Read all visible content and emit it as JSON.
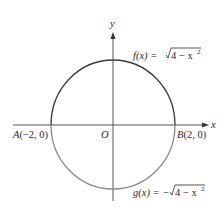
{
  "figure": {
    "axes": {
      "x_label": "x",
      "y_label": "y",
      "origin_label": "O"
    },
    "points": {
      "A": {
        "name": "A",
        "coords": "(−2, 0)"
      },
      "B": {
        "name": "B",
        "coords": "(2, 0)"
      }
    },
    "curves": {
      "upper": {
        "lhs": "f(x) = ",
        "radicand": "4 − x",
        "exp": "2",
        "color": "#3a3a3a"
      },
      "lower": {
        "lhs": "g(x) = −",
        "radicand": "4 − x",
        "exp": "2",
        "color": "#8a8a8a"
      }
    },
    "circle": {
      "center": [
        0,
        0
      ],
      "radius": 2
    }
  }
}
